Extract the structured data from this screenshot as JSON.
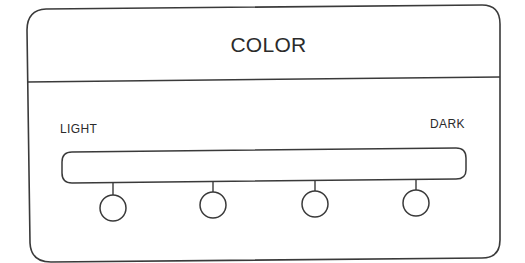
{
  "panel": {
    "title": "COLOR",
    "slider": {
      "start_label": "LIGHT",
      "end_label": "DARK",
      "positions": [
        {
          "index": 1,
          "cx": 113,
          "cy": 208
        },
        {
          "index": 2,
          "cx": 213,
          "cy": 205
        },
        {
          "index": 3,
          "cx": 315,
          "cy": 204
        },
        {
          "index": 4,
          "cx": 416,
          "cy": 203
        }
      ],
      "position_count": 4
    }
  },
  "colors": {
    "stroke": "#3a3a3a",
    "text": "#2b2b2b",
    "background": "#ffffff"
  }
}
